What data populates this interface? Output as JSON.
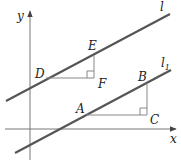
{
  "diagram": {
    "type": "coordinate-geometry",
    "colors": {
      "line": "#555555",
      "axis": "#777777",
      "aux": "#888888",
      "text": "#222222"
    },
    "axes": {
      "x_label": "x",
      "y_label": "y"
    },
    "lines": [
      {
        "name": "l",
        "label": "l",
        "from": [
          6,
          101
        ],
        "to": [
          170,
          14
        ]
      },
      {
        "name": "l1",
        "label": "l",
        "subscript": "1",
        "from": [
          15,
          153
        ],
        "to": [
          171,
          70
        ]
      }
    ],
    "points": [
      {
        "id": "D",
        "label": "D",
        "pos": [
          46,
          78
        ]
      },
      {
        "id": "E",
        "label": "E",
        "pos": [
          94,
          55
        ]
      },
      {
        "id": "F",
        "label": "F",
        "pos": [
          94,
          78
        ]
      },
      {
        "id": "A",
        "label": "A",
        "pos": [
          86,
          115
        ]
      },
      {
        "id": "B",
        "label": "B",
        "pos": [
          147,
          83
        ]
      },
      {
        "id": "C",
        "label": "C",
        "pos": [
          147,
          115
        ]
      }
    ],
    "right_angles": [
      "F",
      "C"
    ]
  }
}
